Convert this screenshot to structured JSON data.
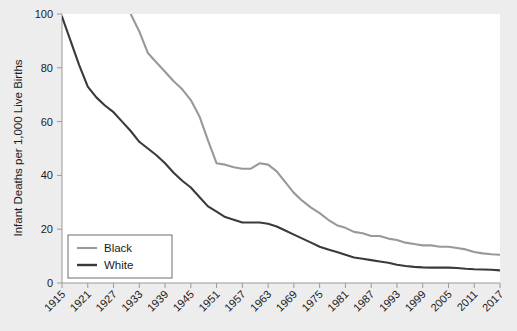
{
  "chart_data": {
    "type": "line",
    "title": "",
    "xlabel": "",
    "ylabel": "Infant Deaths per 1,000 Live Births",
    "xlim": [
      1915,
      2017
    ],
    "ylim": [
      0,
      100
    ],
    "grid": false,
    "legend_position": "bottom-left",
    "yticks": [
      "0",
      "20",
      "40",
      "60",
      "80",
      "100"
    ],
    "ytick_values": [
      0,
      20,
      40,
      60,
      80,
      100
    ],
    "xticks": [
      "1915",
      "1921",
      "1927",
      "1933",
      "1939",
      "1945",
      "1951",
      "1957",
      "1963",
      "1969",
      "1975",
      "1981",
      "1987",
      "1993",
      "1999",
      "2005",
      "2011",
      "2017"
    ],
    "xtick_values": [
      1915,
      1921,
      1927,
      1933,
      1939,
      1945,
      1951,
      1957,
      1963,
      1969,
      1975,
      1981,
      1987,
      1993,
      1999,
      2005,
      2011,
      2017
    ],
    "x": [
      1915,
      1917,
      1919,
      1921,
      1923,
      1925,
      1927,
      1929,
      1931,
      1933,
      1935,
      1937,
      1939,
      1941,
      1943,
      1945,
      1947,
      1949,
      1951,
      1953,
      1955,
      1957,
      1959,
      1961,
      1963,
      1965,
      1967,
      1969,
      1971,
      1973,
      1975,
      1977,
      1979,
      1981,
      1983,
      1985,
      1987,
      1989,
      1991,
      1993,
      1995,
      1997,
      1999,
      2001,
      2003,
      2005,
      2007,
      2009,
      2011,
      2013,
      2015,
      2017
    ],
    "series": [
      {
        "name": "Black",
        "color": "#999999",
        "clipped_above": true,
        "values": [
          181,
          171,
          161,
          151,
          141,
          131,
          121,
          111,
          100,
          93.5,
          85.5,
          82.0,
          78.5,
          75.0,
          72.0,
          68.0,
          62.0,
          53.0,
          44.5,
          44.0,
          43.0,
          42.5,
          42.5,
          44.5,
          44.0,
          41.5,
          37.5,
          33.5,
          30.5,
          28.0,
          26.0,
          23.5,
          21.5,
          20.5,
          19.0,
          18.5,
          17.5,
          17.5,
          16.5,
          16.0,
          15.0,
          14.5,
          14.0,
          14.0,
          13.5,
          13.5,
          13.0,
          12.5,
          11.5,
          11.0,
          10.7,
          10.5
        ]
      },
      {
        "name": "White",
        "color": "#3a3a3a",
        "clipped_above": false,
        "values": [
          99.0,
          90.0,
          81.0,
          73.0,
          69.0,
          66.0,
          63.5,
          60.0,
          56.5,
          52.5,
          50.0,
          47.5,
          44.5,
          41.0,
          38.0,
          35.5,
          32.0,
          28.5,
          26.5,
          24.5,
          23.5,
          22.5,
          22.5,
          22.5,
          22.0,
          21.0,
          19.5,
          18.0,
          16.5,
          15.0,
          13.5,
          12.5,
          11.5,
          10.5,
          9.5,
          9.0,
          8.5,
          8.0,
          7.5,
          6.8,
          6.3,
          6.0,
          5.8,
          5.7,
          5.7,
          5.7,
          5.6,
          5.3,
          5.1,
          5.0,
          4.9,
          4.7
        ]
      }
    ]
  },
  "legend": {
    "entries": [
      {
        "label": "Black",
        "color": "#999999"
      },
      {
        "label": "White",
        "color": "#3a3a3a"
      }
    ]
  }
}
